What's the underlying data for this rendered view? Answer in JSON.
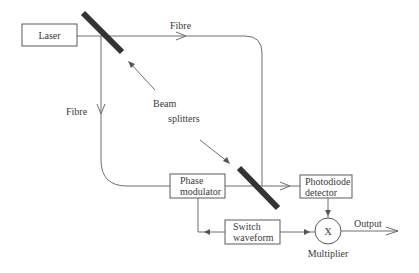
{
  "diagram": {
    "title": "",
    "nodes": {
      "laser": {
        "label": "Laser"
      },
      "phase_modulator": {
        "line1": "Phase",
        "line2": "modulator"
      },
      "photodiode_detector": {
        "line1": "Photodiode",
        "line2": "detector"
      },
      "switch_waveform": {
        "line1": "Switch",
        "line2": "waveform"
      },
      "multiplier": {
        "symbol": "X",
        "label": "Multiplier"
      }
    },
    "labels": {
      "fibre_top": "Fibre",
      "fibre_left": "Fibre",
      "beam": "Beam",
      "splitters": "splitters",
      "output": "Output"
    },
    "colors": {
      "line": "#6e6e6e",
      "splitter": "#333333",
      "text": "#3a3a3a",
      "background": "#ffffff"
    }
  }
}
